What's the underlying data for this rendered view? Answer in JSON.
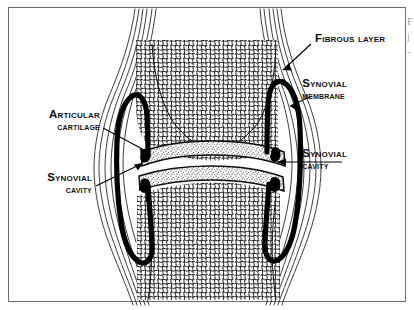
{
  "figure": {
    "kind": "anatomical-diagram",
    "background_color": "#ffffff",
    "ink_color": "#000000",
    "frame_color": "#6b6b6b"
  },
  "labels": {
    "fibrous_layer": {
      "line1": "Fibrous layer",
      "line2": ""
    },
    "synovial_membrane": {
      "line1": "Synovial",
      "line2": "membrane"
    },
    "synovial_cavity_right": {
      "line1": "Synovial",
      "line2": "cavity"
    },
    "articular_cartilage": {
      "line1": "Articular",
      "line2": "cartilage"
    },
    "synovial_cavity_left": {
      "line1": "Synovial",
      "line2": "cavity"
    }
  },
  "edge_fragment": {
    "line1": "F",
    "line2": "j",
    "line3": "-"
  }
}
